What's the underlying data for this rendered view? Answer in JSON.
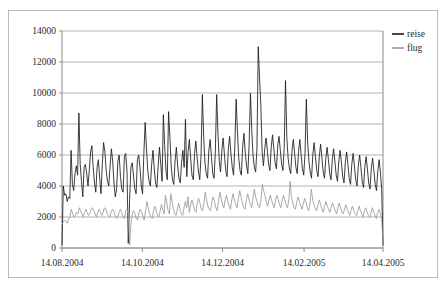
{
  "chart_data": {
    "type": "line",
    "title": "",
    "xlabel": "",
    "ylabel": "",
    "grid": true,
    "legend_position": "right",
    "ylim": [
      0,
      14000
    ],
    "yticks": [
      0,
      2000,
      4000,
      6000,
      8000,
      10000,
      12000,
      14000
    ],
    "ytick_labels": [
      "0",
      "2000",
      "4000",
      "6000",
      "8000",
      "10000",
      "12000",
      "14000"
    ],
    "xtick_labels": [
      "14.08.2004",
      "14.10.2004",
      "14.12.2004",
      "14.02.2005",
      "14.04.2005"
    ],
    "xtick_positions": [
      0,
      61,
      122,
      184,
      244
    ],
    "x_range": [
      0,
      244
    ],
    "x_unit": "days since 14.08.2004",
    "series": [
      {
        "name": "reise",
        "color": "#1a1a1a",
        "values": [
          200,
          4000,
          3400,
          3500,
          3000,
          3300,
          3200,
          6300,
          4100,
          3700,
          4800,
          5300,
          4700,
          8700,
          5400,
          4300,
          3300,
          5200,
          5400,
          4800,
          4000,
          5000,
          6200,
          6600,
          5200,
          4200,
          3600,
          5200,
          5700,
          4500,
          3500,
          5400,
          6800,
          6200,
          5000,
          4300,
          4000,
          5300,
          6400,
          5600,
          4200,
          3300,
          3800,
          5600,
          6000,
          4600,
          3800,
          3600,
          5900,
          6100,
          5000,
          300,
          3100,
          5200,
          5500,
          4700,
          3800,
          3500,
          5700,
          6000,
          5200,
          4000,
          3500,
          6100,
          8100,
          6400,
          5000,
          4300,
          4000,
          5400,
          6300,
          5100,
          4200,
          3900,
          5300,
          6500,
          5400,
          4300,
          8600,
          6600,
          5000,
          4400,
          8800,
          7200,
          5300,
          4400,
          4100,
          5600,
          6500,
          5300,
          4500,
          4200,
          5500,
          6300,
          5200,
          8300,
          4600,
          6200,
          7000,
          5800,
          4700,
          4400,
          6100,
          6900,
          5800,
          4900,
          4400,
          6000,
          9900,
          7200,
          5500,
          4800,
          4500,
          6300,
          7000,
          5900,
          4800,
          4500,
          6200,
          9900,
          7400,
          5600,
          4900,
          6300,
          7100,
          6000,
          5000,
          4600,
          6400,
          7200,
          6100,
          5200,
          4700,
          6600,
          9600,
          7500,
          5800,
          5000,
          4700,
          6500,
          7400,
          6200,
          5300,
          4800,
          6700,
          10000,
          7600,
          6000,
          5200,
          4900,
          6400,
          13000,
          11000,
          9200,
          6200,
          5300,
          6400,
          7100,
          6300,
          5400,
          5000,
          6500,
          7300,
          6400,
          5500,
          5100,
          6600,
          7200,
          6300,
          5400,
          5000,
          6500,
          10800,
          7100,
          5800,
          5100,
          4800,
          6300,
          7000,
          6100,
          5200,
          4800,
          6200,
          7000,
          6000,
          5100,
          4700,
          6100,
          9600,
          6900,
          5600,
          4900,
          4500,
          6000,
          6800,
          5900,
          5000,
          4600,
          5900,
          6700,
          5800,
          4900,
          4500,
          5800,
          6500,
          5700,
          4800,
          4400,
          5700,
          6400,
          5600,
          4700,
          4300,
          5600,
          6300,
          5500,
          4600,
          4200,
          5500,
          6200,
          5400,
          4500,
          4100,
          5400,
          6100,
          5300,
          4400,
          4000,
          5300,
          6000,
          5200,
          4300,
          3900,
          5200,
          5900,
          5100,
          4200,
          3800,
          5100,
          5800,
          5000,
          4100,
          3700,
          5000,
          5700,
          4900,
          3800,
          200
        ]
      },
      {
        "name": "flug",
        "color": "#9a9a9a",
        "values": [
          1500,
          1700,
          1800,
          1700,
          1600,
          1900,
          2000,
          2500,
          2200,
          2000,
          2100,
          2300,
          2200,
          2600,
          2400,
          2200,
          2000,
          2300,
          2500,
          2300,
          2100,
          2200,
          2500,
          2600,
          2400,
          2200,
          2000,
          2300,
          2500,
          2300,
          2100,
          2300,
          2600,
          2500,
          2200,
          2100,
          2000,
          2300,
          2500,
          2400,
          2100,
          1900,
          2000,
          2300,
          2500,
          2300,
          2000,
          1900,
          2400,
          2500,
          2200,
          200,
          1600,
          2200,
          2400,
          2200,
          1900,
          1800,
          2300,
          2500,
          2300,
          2000,
          1800,
          2400,
          3000,
          2600,
          2200,
          2000,
          1900,
          2400,
          2700,
          2400,
          2100,
          2000,
          2400,
          2800,
          2500,
          2200,
          3400,
          2900,
          2400,
          2200,
          3500,
          3000,
          2500,
          2200,
          2100,
          2500,
          2900,
          2500,
          2200,
          2100,
          2600,
          3000,
          2600,
          3300,
          2300,
          2800,
          3100,
          2800,
          2400,
          2300,
          2900,
          3200,
          2900,
          2500,
          2400,
          2900,
          3600,
          3100,
          2700,
          2500,
          2400,
          3000,
          3300,
          3000,
          2600,
          2400,
          3000,
          3600,
          3200,
          2800,
          2600,
          3100,
          3400,
          3000,
          2700,
          2500,
          3100,
          3500,
          3100,
          2800,
          2600,
          3200,
          3700,
          3300,
          2900,
          2600,
          2500,
          3100,
          3500,
          3100,
          2800,
          2600,
          3200,
          3800,
          3300,
          3000,
          2700,
          2600,
          3100,
          4100,
          3700,
          3400,
          3000,
          2700,
          3100,
          3400,
          3100,
          2800,
          2600,
          3100,
          3400,
          3100,
          2800,
          2600,
          3100,
          3400,
          3100,
          2800,
          2600,
          3100,
          4300,
          3300,
          2900,
          2600,
          2500,
          3000,
          3300,
          3000,
          2700,
          2500,
          2900,
          3200,
          2900,
          2600,
          2400,
          2900,
          3800,
          3100,
          2800,
          2500,
          2400,
          2800,
          3100,
          2800,
          2500,
          2300,
          2700,
          3000,
          2700,
          2500,
          2300,
          2700,
          2900,
          2600,
          2400,
          2200,
          2600,
          2900,
          2600,
          2300,
          2200,
          2500,
          2800,
          2500,
          2300,
          2100,
          2500,
          2700,
          2400,
          2200,
          2100,
          2400,
          2700,
          2400,
          2200,
          2000,
          2400,
          2600,
          2300,
          2100,
          2000,
          2300,
          2600,
          2300,
          2100,
          1900,
          2300,
          2500,
          2200,
          1900,
          200
        ]
      }
    ]
  },
  "legend": {
    "items": [
      {
        "label": "reise",
        "color": "#1a1a1a"
      },
      {
        "label": "flug",
        "color": "#9a9a9a"
      }
    ]
  },
  "axes": {
    "y_tick_labels": [
      "14000",
      "12000",
      "10000",
      "8000",
      "6000",
      "4000",
      "2000",
      "0"
    ],
    "x_tick_labels": [
      "14.08.2004",
      "14.10.2004",
      "14.12.2004",
      "14.02.2005",
      "14.04.2005"
    ]
  }
}
